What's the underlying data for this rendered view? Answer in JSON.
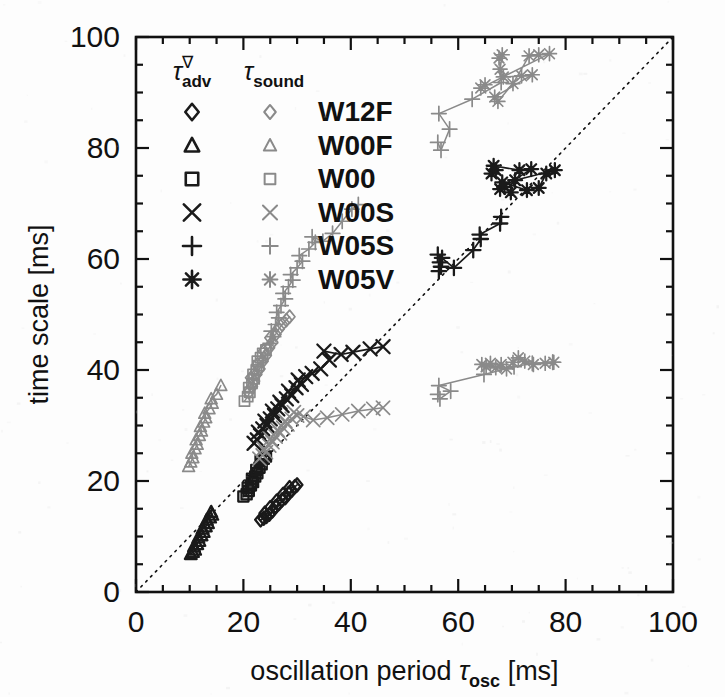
{
  "figure": {
    "background_color": "#fdfdfd",
    "frame_color": "#111111",
    "adv_color": "#1a1a1a",
    "sound_color": "#8a8a8a",
    "reference_line_style": "dotted",
    "reference_line_label": "1:1 line"
  },
  "axes": {
    "x": {
      "label_prefix": "oscillation period ",
      "label_symbol": "τ",
      "label_subscript": "osc",
      "label_units": " [ms]",
      "label_full": "oscillation period τosc [ms]",
      "ticks": [
        0,
        20,
        40,
        60,
        80,
        100
      ],
      "tick_labels": [
        "0",
        "20",
        "40",
        "60",
        "80",
        "100"
      ],
      "minor_tick_step": 5,
      "range": [
        0,
        100
      ]
    },
    "y": {
      "label_full": "time scale [ms]",
      "ticks": [
        0,
        20,
        40,
        60,
        80,
        100
      ],
      "tick_labels": [
        "0",
        "20",
        "40",
        "60",
        "80",
        "100"
      ],
      "minor_tick_step": 5,
      "range": [
        0,
        100
      ]
    }
  },
  "legend": {
    "header_adv": {
      "symbol": "τ",
      "superscript": "∇",
      "subscript": "adv",
      "text": "τ∇adv"
    },
    "header_sound": {
      "symbol": "τ",
      "subscript": "sound",
      "text": "τsound"
    },
    "entries": [
      {
        "label": "W12F",
        "marker": "diamond"
      },
      {
        "label": "W00F",
        "marker": "triangle"
      },
      {
        "label": "W00",
        "marker": "square"
      },
      {
        "label": "W00S",
        "marker": "cross-x"
      },
      {
        "label": "W05S",
        "marker": "plus"
      },
      {
        "label": "W05V",
        "marker": "asterisk"
      }
    ]
  },
  "chart_data": {
    "type": "scatter",
    "title": "",
    "xlabel": "oscillation period τosc [ms]",
    "ylabel": "time scale [ms]",
    "xlim": [
      0,
      100
    ],
    "ylim": [
      0,
      100
    ],
    "grid": false,
    "legend_position": "upper-left-inside",
    "reference_line": {
      "type": "identity",
      "x": [
        0,
        100
      ],
      "y": [
        0,
        100
      ],
      "style": "dotted"
    },
    "series": [
      {
        "name": "W12F",
        "quantity": "tau_adv",
        "marker": "diamond",
        "color": "#1a1a1a",
        "connected": true,
        "points": [
          [
            23.2,
            13.0
          ],
          [
            23.8,
            13.3
          ],
          [
            24.3,
            13.6
          ],
          [
            24.0,
            14.2
          ],
          [
            24.8,
            14.0
          ],
          [
            25.4,
            14.6
          ],
          [
            25.0,
            15.2
          ],
          [
            26.0,
            15.4
          ],
          [
            26.6,
            15.9
          ],
          [
            26.2,
            16.4
          ],
          [
            27.2,
            16.6
          ],
          [
            27.8,
            17.0
          ],
          [
            27.4,
            17.6
          ],
          [
            28.4,
            17.8
          ],
          [
            29.0,
            18.3
          ],
          [
            28.6,
            18.8
          ],
          [
            29.6,
            19.0
          ],
          [
            30.0,
            19.3
          ]
        ]
      },
      {
        "name": "W12F",
        "quantity": "tau_sound",
        "marker": "diamond",
        "color": "#8a8a8a",
        "connected": true,
        "points": [
          [
            21.0,
            36.0
          ],
          [
            21.6,
            37.0
          ],
          [
            22.0,
            38.0
          ],
          [
            21.4,
            38.6
          ],
          [
            22.4,
            39.2
          ],
          [
            23.0,
            40.2
          ],
          [
            22.6,
            41.0
          ],
          [
            23.6,
            41.6
          ],
          [
            24.2,
            42.6
          ],
          [
            23.8,
            43.4
          ],
          [
            24.8,
            44.0
          ],
          [
            25.4,
            45.0
          ],
          [
            25.0,
            45.8
          ],
          [
            26.0,
            46.4
          ],
          [
            26.6,
            47.4
          ],
          [
            27.2,
            48.2
          ],
          [
            28.0,
            49.0
          ],
          [
            28.6,
            49.6
          ]
        ]
      },
      {
        "name": "W00F",
        "quantity": "tau_adv",
        "marker": "triangle",
        "color": "#1a1a1a",
        "connected": true,
        "points": [
          [
            10.2,
            6.8
          ],
          [
            10.6,
            7.2
          ],
          [
            11.0,
            7.6
          ],
          [
            10.8,
            8.2
          ],
          [
            11.4,
            8.6
          ],
          [
            11.8,
            9.2
          ],
          [
            11.6,
            9.8
          ],
          [
            12.2,
            10.2
          ],
          [
            12.6,
            10.8
          ],
          [
            12.4,
            11.4
          ],
          [
            13.0,
            11.8
          ],
          [
            13.4,
            12.4
          ],
          [
            13.2,
            13.0
          ],
          [
            13.8,
            13.4
          ],
          [
            14.2,
            13.9
          ],
          [
            14.0,
            14.4
          ]
        ]
      },
      {
        "name": "W00F",
        "quantity": "tau_sound",
        "marker": "triangle",
        "color": "#8a8a8a",
        "connected": true,
        "points": [
          [
            9.8,
            22.6
          ],
          [
            10.2,
            23.4
          ],
          [
            10.6,
            24.2
          ],
          [
            10.4,
            25.0
          ],
          [
            11.0,
            25.8
          ],
          [
            11.4,
            26.6
          ],
          [
            11.2,
            27.4
          ],
          [
            11.8,
            28.2
          ],
          [
            12.2,
            29.0
          ],
          [
            12.0,
            29.8
          ],
          [
            12.6,
            30.6
          ],
          [
            13.0,
            31.4
          ],
          [
            12.8,
            32.2
          ],
          [
            13.6,
            33.0
          ],
          [
            14.2,
            34.0
          ],
          [
            14.0,
            34.8
          ],
          [
            15.0,
            35.6
          ],
          [
            15.8,
            37.2
          ]
        ]
      },
      {
        "name": "W00",
        "quantity": "tau_adv",
        "marker": "square",
        "color": "#1a1a1a",
        "connected": true,
        "points": [
          [
            20.0,
            17.2
          ],
          [
            20.6,
            17.6
          ],
          [
            21.0,
            18.2
          ],
          [
            20.8,
            18.8
          ],
          [
            21.4,
            19.2
          ],
          [
            21.8,
            19.8
          ],
          [
            21.6,
            20.4
          ],
          [
            22.2,
            20.8
          ],
          [
            22.6,
            21.4
          ],
          [
            22.4,
            22.0
          ],
          [
            23.0,
            22.4
          ],
          [
            23.4,
            23.0
          ],
          [
            23.2,
            23.6
          ],
          [
            23.8,
            24.0
          ],
          [
            24.2,
            24.4
          ]
        ]
      },
      {
        "name": "W00",
        "quantity": "tau_sound",
        "marker": "square",
        "color": "#8a8a8a",
        "connected": true,
        "points": [
          [
            20.2,
            34.4
          ],
          [
            20.8,
            35.2
          ],
          [
            21.2,
            36.0
          ],
          [
            21.0,
            36.8
          ],
          [
            21.6,
            37.6
          ],
          [
            22.0,
            38.4
          ],
          [
            21.8,
            39.2
          ],
          [
            22.4,
            40.0
          ],
          [
            22.8,
            40.8
          ],
          [
            22.6,
            41.6
          ],
          [
            23.2,
            42.2
          ],
          [
            23.6,
            43.0
          ],
          [
            24.2,
            43.6
          ]
        ]
      },
      {
        "name": "W00S",
        "quantity": "tau_adv",
        "marker": "cross-x",
        "color": "#1a1a1a",
        "connected": true,
        "points": [
          [
            22.0,
            26.8
          ],
          [
            22.6,
            27.4
          ],
          [
            23.2,
            28.2
          ],
          [
            22.8,
            28.8
          ],
          [
            23.6,
            29.4
          ],
          [
            24.4,
            30.0
          ],
          [
            24.0,
            30.8
          ],
          [
            25.0,
            31.2
          ],
          [
            25.8,
            31.8
          ],
          [
            25.4,
            32.6
          ],
          [
            26.4,
            33.0
          ],
          [
            27.2,
            33.6
          ],
          [
            26.8,
            34.2
          ],
          [
            28.0,
            34.8
          ],
          [
            29.0,
            35.4
          ],
          [
            28.4,
            36.2
          ],
          [
            29.8,
            36.8
          ],
          [
            30.8,
            37.4
          ],
          [
            30.2,
            38.2
          ],
          [
            31.6,
            38.8
          ],
          [
            32.8,
            39.4
          ],
          [
            34.4,
            40.2
          ],
          [
            36.0,
            41.8
          ],
          [
            35.0,
            43.4
          ],
          [
            38.2,
            42.8
          ],
          [
            40.4,
            43.2
          ],
          [
            43.6,
            43.8
          ],
          [
            46.0,
            44.2
          ]
        ]
      },
      {
        "name": "W00S",
        "quantity": "tau_sound",
        "marker": "cross-x",
        "color": "#8a8a8a",
        "connected": true,
        "points": [
          [
            23.0,
            24.0
          ],
          [
            23.6,
            24.6
          ],
          [
            24.2,
            25.2
          ],
          [
            23.8,
            25.8
          ],
          [
            24.8,
            26.4
          ],
          [
            25.4,
            27.0
          ],
          [
            25.0,
            27.6
          ],
          [
            26.0,
            28.0
          ],
          [
            26.8,
            28.6
          ],
          [
            26.4,
            29.2
          ],
          [
            27.4,
            29.6
          ],
          [
            28.2,
            30.2
          ],
          [
            27.8,
            30.8
          ],
          [
            29.0,
            31.2
          ],
          [
            30.0,
            31.8
          ],
          [
            29.4,
            32.4
          ],
          [
            31.2,
            31.6
          ],
          [
            33.0,
            31.0
          ],
          [
            35.6,
            31.4
          ],
          [
            38.4,
            32.0
          ],
          [
            41.4,
            32.6
          ],
          [
            44.2,
            33.0
          ],
          [
            46.0,
            33.2
          ]
        ]
      },
      {
        "name": "W05S",
        "quantity": "tau_adv",
        "marker": "plus",
        "color": "#1a1a1a",
        "connected": true,
        "points": [
          [
            56.4,
            57.8
          ],
          [
            56.8,
            58.6
          ],
          [
            56.6,
            59.4
          ],
          [
            57.0,
            60.2
          ],
          [
            56.2,
            60.8
          ],
          [
            59.2,
            58.4
          ],
          [
            62.8,
            61.6
          ],
          [
            64.2,
            63.6
          ],
          [
            64.0,
            64.4
          ],
          [
            67.8,
            66.4
          ],
          [
            68.0,
            67.6
          ]
        ]
      },
      {
        "name": "W05S",
        "quantity": "tau_sound",
        "marker": "plus",
        "color": "#8a8a8a",
        "connected": true,
        "points": [
          [
            25.0,
            44.8
          ],
          [
            25.6,
            46.0
          ],
          [
            25.2,
            47.0
          ],
          [
            26.0,
            48.2
          ],
          [
            26.6,
            49.4
          ],
          [
            26.2,
            50.4
          ],
          [
            27.0,
            51.6
          ],
          [
            27.8,
            52.8
          ],
          [
            27.4,
            53.8
          ],
          [
            28.4,
            55.0
          ],
          [
            29.2,
            56.2
          ],
          [
            28.8,
            57.2
          ],
          [
            30.0,
            58.4
          ],
          [
            31.0,
            59.6
          ],
          [
            30.4,
            60.6
          ],
          [
            32.2,
            61.8
          ],
          [
            33.4,
            63.0
          ],
          [
            32.8,
            64.0
          ],
          [
            34.8,
            63.2
          ],
          [
            36.6,
            64.6
          ],
          [
            38.4,
            66.8
          ],
          [
            40.2,
            69.0
          ],
          [
            41.4,
            69.8
          ]
        ]
      },
      {
        "name": "W05S-high",
        "quantity": "tau_sound",
        "marker": "plus",
        "color": "#8a8a8a",
        "connected": true,
        "points": [
          [
            56.2,
            81.0
          ],
          [
            56.8,
            79.6
          ],
          [
            58.4,
            83.4
          ],
          [
            56.4,
            86.2
          ],
          [
            62.6,
            88.8
          ],
          [
            68.0,
            91.8
          ]
        ]
      },
      {
        "name": "W05S-low",
        "quantity": "tau_sound",
        "marker": "plus",
        "color": "#8a8a8a",
        "connected": true,
        "points": [
          [
            56.2,
            35.6
          ],
          [
            56.6,
            34.8
          ],
          [
            58.6,
            36.2
          ],
          [
            56.4,
            37.2
          ],
          [
            64.8,
            39.2
          ],
          [
            70.4,
            40.6
          ],
          [
            73.8,
            41.2
          ],
          [
            77.6,
            41.4
          ]
        ]
      },
      {
        "name": "W05V",
        "quantity": "tau_adv",
        "marker": "asterisk",
        "color": "#1a1a1a",
        "connected": true,
        "points": [
          [
            66.2,
            75.4
          ],
          [
            67.0,
            76.0
          ],
          [
            66.6,
            76.8
          ],
          [
            71.4,
            76.0
          ],
          [
            73.6,
            76.2
          ],
          [
            67.8,
            72.6
          ],
          [
            68.6,
            73.0
          ],
          [
            68.2,
            73.8
          ],
          [
            72.8,
            72.4
          ],
          [
            75.0,
            72.8
          ],
          [
            76.4,
            75.4
          ],
          [
            78.0,
            76.0
          ],
          [
            70.6,
            74.2
          ],
          [
            69.8,
            72.0
          ]
        ]
      },
      {
        "name": "W05V",
        "quantity": "tau_sound",
        "marker": "asterisk",
        "color": "#8a8a8a",
        "connected": true,
        "points": [
          [
            67.6,
            96.2
          ],
          [
            68.2,
            96.8
          ],
          [
            67.8,
            94.2
          ],
          [
            68.4,
            92.8
          ],
          [
            71.8,
            93.0
          ],
          [
            73.8,
            93.2
          ],
          [
            66.8,
            89.2
          ],
          [
            67.4,
            88.4
          ],
          [
            70.2,
            91.6
          ],
          [
            73.2,
            96.6
          ],
          [
            75.0,
            96.8
          ],
          [
            77.0,
            97.0
          ],
          [
            64.2,
            90.8
          ],
          [
            65.0,
            91.4
          ]
        ]
      },
      {
        "name": "W05V-low",
        "quantity": "tau_sound",
        "marker": "asterisk",
        "color": "#8a8a8a",
        "connected": true,
        "points": [
          [
            64.4,
            41.0
          ],
          [
            65.2,
            40.6
          ],
          [
            66.0,
            41.2
          ],
          [
            67.0,
            40.4
          ],
          [
            68.0,
            41.0
          ],
          [
            69.0,
            40.2
          ],
          [
            70.2,
            41.4
          ],
          [
            71.2,
            42.2
          ],
          [
            72.4,
            41.6
          ],
          [
            74.0,
            41.0
          ],
          [
            76.2,
            41.2
          ],
          [
            77.8,
            41.4
          ]
        ]
      }
    ]
  }
}
